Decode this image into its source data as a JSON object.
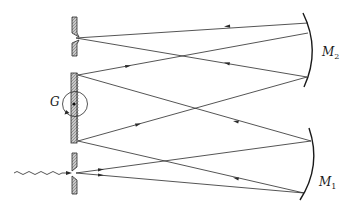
{
  "diagram": {
    "type": "optical-schematic",
    "title": "",
    "colors": {
      "line": "#2a2a2a",
      "hatch": "#9a9a9a",
      "background": "#ffffff"
    },
    "labels": {
      "grating": "G",
      "mirror_top_main": "M",
      "mirror_top_sub": "2",
      "mirror_bottom_main": "M",
      "mirror_bottom_sub": "1"
    },
    "components": [
      {
        "id": "exit-slit",
        "kind": "slit",
        "x": 74,
        "y_top": 17,
        "y_bottom": 56,
        "gap_y": 38
      },
      {
        "id": "grating",
        "kind": "diffraction-grating",
        "label": "G",
        "x": 75,
        "y_top": 73,
        "y_bottom": 143,
        "pivot": [
          74,
          104
        ]
      },
      {
        "id": "entrance-slit",
        "kind": "slit",
        "x": 74,
        "y_top": 153,
        "y_bottom": 194,
        "gap_y": 173
      },
      {
        "id": "mirror-m2",
        "kind": "concave-mirror",
        "label": "M2"
      },
      {
        "id": "mirror-m1",
        "kind": "concave-mirror",
        "label": "M1"
      },
      {
        "id": "input-light",
        "kind": "wavy-arrow",
        "from": [
          14,
          173
        ],
        "to": [
          70,
          173
        ]
      }
    ],
    "rays": [
      {
        "from": [
          76,
          173
        ],
        "to": [
          311,
          141
        ],
        "arrow_at": [
          100,
          170
        ],
        "direction": "right"
      },
      {
        "from": [
          76,
          173
        ],
        "to": [
          304,
          193
        ],
        "arrow_at": [
          100,
          176
        ],
        "direction": "right"
      },
      {
        "from": [
          311,
          141
        ],
        "to": [
          78,
          75
        ],
        "arrow_at": [
          236,
          121
        ],
        "direction": "left"
      },
      {
        "from": [
          304,
          193
        ],
        "to": [
          78,
          141
        ],
        "arrow_at": [
          236,
          178
        ],
        "direction": "left"
      },
      {
        "from": [
          78,
          75
        ],
        "to": [
          308,
          33
        ],
        "arrow_at": [
          128,
          66
        ],
        "direction": "right"
      },
      {
        "from": [
          78,
          141
        ],
        "to": [
          307,
          77
        ],
        "arrow_at": [
          127,
          126
        ],
        "direction": "right"
      },
      {
        "from": [
          308,
          33
        ],
        "to": [
          76,
          38
        ],
        "arrow_at": [
          228,
          26
        ],
        "direction": "left"
      },
      {
        "from": [
          307,
          77
        ],
        "to": [
          76,
          38
        ],
        "arrow_at": [
          228,
          62
        ],
        "direction": "left"
      }
    ]
  }
}
